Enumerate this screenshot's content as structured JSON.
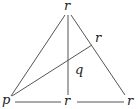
{
  "diagram": {
    "type": "triangle-with-cevians",
    "stroke_color": "#555555",
    "label_color": "#222222",
    "labels": {
      "apex": "r",
      "right_side_point": "r",
      "intersection": "q",
      "bottom_left": "p",
      "bottom_mid": "r",
      "bottom_right": "r"
    },
    "points": {
      "apex": [
        68,
        13
      ],
      "bottom_left": [
        12,
        98
      ],
      "bottom_mid": [
        68,
        98
      ],
      "bottom_right": [
        126,
        98
      ],
      "right_side_point": [
        92,
        45
      ],
      "intersection": [
        68,
        61
      ]
    },
    "segments": [
      {
        "name": "left-side",
        "from": "apex",
        "to": "bottom_left"
      },
      {
        "name": "right-side",
        "from": "apex",
        "to": "bottom_right"
      },
      {
        "name": "median-vertical",
        "from": "apex",
        "to": "bottom_mid"
      },
      {
        "name": "cevian-p-to-r",
        "from": "bottom_left",
        "to": "right_side_point"
      },
      {
        "name": "base-left",
        "from": "bottom_left",
        "to": "bottom_mid"
      },
      {
        "name": "base-right",
        "from": "bottom_mid",
        "to": "bottom_right"
      }
    ]
  }
}
